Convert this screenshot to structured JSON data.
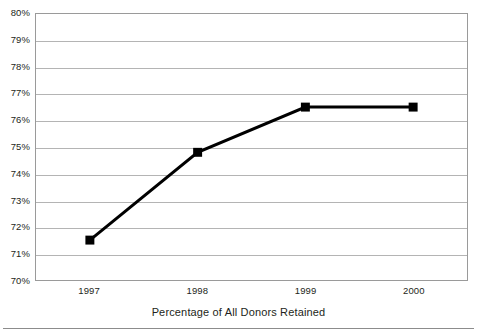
{
  "chart_data": {
    "type": "line",
    "title": "Percentage of All Donors Retained",
    "xlabel": "",
    "ylabel": "",
    "categories": [
      "1997",
      "1998",
      "1999",
      "2000"
    ],
    "values": [
      71.5,
      74.8,
      76.5,
      76.5
    ],
    "series": [
      {
        "name": "Percentage of All Donors Retained",
        "values": [
          71.5,
          74.8,
          76.5,
          76.5
        ]
      }
    ],
    "ylim": [
      70,
      80
    ],
    "ytick_values": [
      80,
      79,
      78,
      77,
      76,
      75,
      74,
      73,
      72,
      71,
      70
    ],
    "ytick_labels": [
      "80%",
      "79%",
      "78%",
      "77%",
      "76%",
      "75%",
      "74%",
      "73%",
      "72%",
      "71%",
      "70%"
    ],
    "grid": "horizontal",
    "legend": "none",
    "marker": "square",
    "line_color": "#000000",
    "marker_color": "#000000",
    "grid_color": "#b4b4b4",
    "axis_color": "#9a9a9a",
    "caption_position": "below-axis"
  }
}
